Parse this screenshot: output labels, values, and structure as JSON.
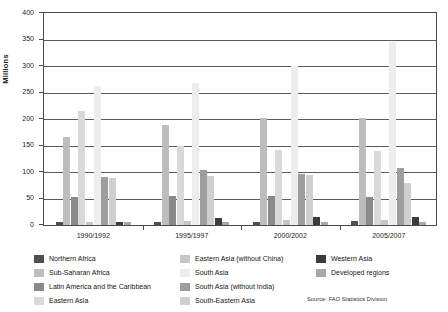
{
  "chart_data": {
    "type": "bar",
    "title": "",
    "subtitle": "",
    "xlabel": "",
    "ylabel": "Millions",
    "ylim": [
      0,
      400
    ],
    "ytick_step": 50,
    "ytick_labels": [
      "400",
      "350",
      "300",
      "250",
      "200",
      "150",
      "100",
      "50",
      "0"
    ],
    "ytick_values": [
      400,
      350,
      300,
      250,
      200,
      150,
      100,
      50,
      0
    ],
    "grid": true,
    "grid_axis": "y",
    "legend_position": "bottom",
    "categories": [
      "1990/1992",
      "1995/1997",
      "2000/2002",
      "2005/2007"
    ],
    "series": [
      {
        "name": "Northern Africa",
        "color": "#4f4f4f",
        "values": [
          5,
          5,
          6,
          7
        ]
      },
      {
        "name": "Sub-Saharan Africa",
        "color": "#bdbdbd",
        "values": [
          166,
          189,
          201,
          202
        ]
      },
      {
        "name": "Latin America and the Caribbean",
        "color": "#8a8a8a",
        "values": [
          53,
          55,
          54,
          52
        ]
      },
      {
        "name": "Eastern Asia",
        "color": "#d9d9d9",
        "values": [
          215,
          150,
          142,
          140
        ]
      },
      {
        "name": "Eastern Asia (without China)",
        "color": "#c6c6c6",
        "values": [
          6,
          8,
          9,
          10
        ]
      },
      {
        "name": "South Asia",
        "color": "#ededed",
        "values": [
          262,
          268,
          300,
          345
        ]
      },
      {
        "name": "South Asia (without India)",
        "color": "#9e9e9e",
        "values": [
          91,
          103,
          97,
          108
        ]
      },
      {
        "name": "South-Eastern Asia",
        "color": "#cfcfcf",
        "values": [
          89,
          93,
          94,
          80
        ]
      },
      {
        "name": "Western Asia",
        "color": "#3c3c3c",
        "values": [
          6,
          13,
          15,
          16
        ]
      },
      {
        "name": "Developed regions",
        "color": "#a8a8a8",
        "values": [
          5,
          5,
          6,
          6
        ]
      }
    ]
  },
  "legend": {
    "columns": [
      [
        {
          "label": "Northern Africa",
          "color": "#4f4f4f"
        },
        {
          "label": "Sub-Saharan Africa",
          "color": "#bdbdbd"
        },
        {
          "label": "Latin America and the Caribbean",
          "color": "#8a8a8a"
        },
        {
          "label": "Eastern Asia",
          "color": "#d9d9d9"
        }
      ],
      [
        {
          "label": "Eastern Asia (without China)",
          "color": "#c6c6c6"
        },
        {
          "label": "South Asia",
          "color": "#ededed"
        },
        {
          "label": "South Asia (without India)",
          "color": "#9e9e9e"
        },
        {
          "label": "South-Eastern Asia",
          "color": "#cfcfcf"
        }
      ],
      [
        {
          "label": "Western Asia",
          "color": "#3c3c3c"
        },
        {
          "label": "Developed regions",
          "color": "#a8a8a8"
        }
      ]
    ]
  },
  "source": {
    "text": "Source: FAO Statistics Division"
  }
}
